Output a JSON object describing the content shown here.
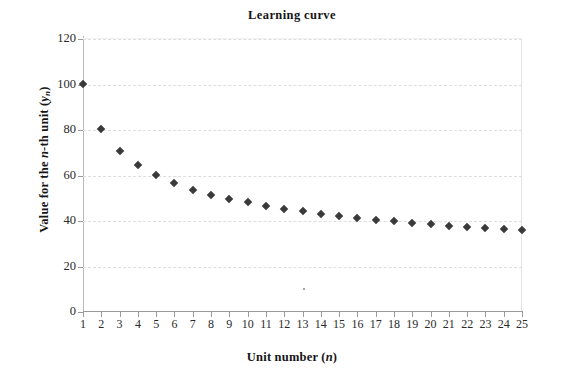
{
  "chart_data": {
    "type": "scatter",
    "title": "Learning curve",
    "xlabel": "Unit number (n)",
    "ylabel": "Value for the n-th unit (yₙ)",
    "xlabel_parts": {
      "main": "Unit number (",
      "italic": "n",
      "tail": ")"
    },
    "ylabel_parts": {
      "lead": "Value for the ",
      "italic1": "n",
      "mid": "-th unit (",
      "italic2": "y",
      "sub": "n",
      "tail": ")"
    },
    "x": [
      1,
      2,
      3,
      4,
      5,
      6,
      7,
      8,
      9,
      10,
      11,
      12,
      13,
      14,
      15,
      16,
      17,
      18,
      19,
      20,
      21,
      22,
      23,
      24,
      25
    ],
    "values": [
      100.0,
      80.0,
      70.2,
      64.0,
      59.6,
      56.2,
      53.4,
      51.2,
      49.3,
      47.7,
      46.3,
      45.0,
      43.8,
      42.8,
      41.8,
      41.0,
      40.2,
      39.4,
      38.7,
      38.1,
      37.5,
      37.0,
      36.5,
      36.0,
      35.5
    ],
    "categories": [
      "1",
      "2",
      "3",
      "4",
      "5",
      "6",
      "7",
      "8",
      "9",
      "10",
      "11",
      "12",
      "13",
      "14",
      "15",
      "16",
      "17",
      "18",
      "19",
      "20",
      "21",
      "22",
      "23",
      "24",
      "25"
    ],
    "xtick_labels": [
      "1",
      "2",
      "3",
      "4",
      "5",
      "6",
      "7",
      "8",
      "9",
      "10",
      "11",
      "12",
      "13",
      "14",
      "15",
      "16",
      "17",
      "18",
      "19",
      "20",
      "21",
      "22",
      "23",
      "24",
      "25"
    ],
    "ytick_labels": [
      "0",
      "20",
      "40",
      "60",
      "80",
      "100",
      "120"
    ],
    "ytick_values": [
      0,
      20,
      40,
      60,
      80,
      100,
      120
    ],
    "ylim": [
      0,
      120
    ],
    "xlim": [
      1,
      25
    ],
    "grid": "horizontal-dashed",
    "legend": "none",
    "marker": "diamond",
    "marker_color": "#3a3a3a",
    "gridline_color": "#dedede",
    "axis_color": "#9a9a9a",
    "background": "#ffffff",
    "annotation": "80% learning curve: y_n = 100 * n^(-0.3219)"
  }
}
